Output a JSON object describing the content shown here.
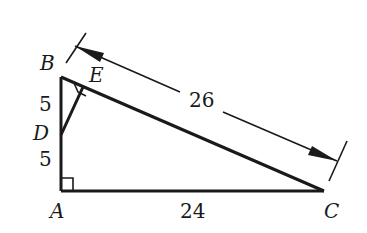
{
  "figure": {
    "type": "right triangle geometry diagram",
    "vertices": {
      "A": "A",
      "B": "B",
      "C": "C",
      "D": "D",
      "E": "E"
    },
    "measurements": {
      "BD": "5",
      "DA": "5",
      "AC": "24",
      "BC": "26"
    },
    "right_angles": [
      "A",
      "E"
    ],
    "segments": [
      "AB",
      "AC",
      "BC",
      "DE"
    ],
    "colors": {
      "stroke": "#1a1a1a",
      "background": "#ffffff"
    }
  }
}
